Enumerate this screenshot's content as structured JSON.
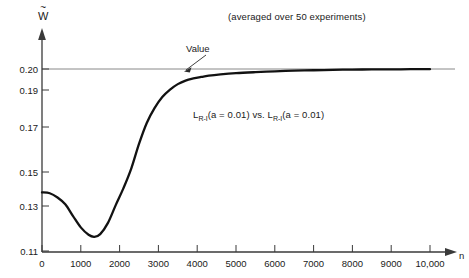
{
  "figure": {
    "subtitle": "(averaged over 50 experiments)",
    "y_axis_label": "W",
    "y_axis_label_accent": "~",
    "x_axis_label": "n"
  },
  "annotations": {
    "value_line_label": "Value",
    "series_label_prefix": "L",
    "series_label_sub": "R-I",
    "series_label_mid": "(a = 0.01) vs. L",
    "series_label_sub2": "R-I",
    "series_label_suffix": "(a = 0.01)",
    "series_label_full": "L_{R-I}(a = 0.01) vs. L_{R-I}(a = 0.01)"
  },
  "chart_data": {
    "type": "line",
    "title": "",
    "subtitle": "(averaged over 50 experiments)",
    "xlabel": "n",
    "ylabel": "W~",
    "xlim": [
      0,
      10000
    ],
    "ylim": [
      0.11,
      0.205
    ],
    "grid": false,
    "legend": "none",
    "x_ticks": [
      0,
      1000,
      2000,
      3000,
      4000,
      5000,
      6000,
      7000,
      8000,
      9000,
      10000
    ],
    "x_tick_labels": [
      "0",
      "1000",
      "2000",
      "3000",
      "4000",
      "5000",
      "6000",
      "7000",
      "8000",
      "9000",
      "10,000"
    ],
    "y_ticks": [
      0.11,
      0.13,
      0.15,
      0.17,
      0.19,
      0.2
    ],
    "y_tick_labels": [
      "0.11",
      "0.13",
      "0.15",
      "0.17",
      "0.19",
      "0.20"
    ],
    "reference_lines": [
      {
        "name": "Value",
        "orientation": "horizontal",
        "y": 0.2,
        "label": "Value"
      }
    ],
    "series": [
      {
        "name": "L_{R-I}(a = 0.01) vs. L_{R-I}(a = 0.01)",
        "x": [
          0,
          200,
          400,
          600,
          800,
          1000,
          1200,
          1350,
          1500,
          1700,
          1900,
          2100,
          2300,
          2500,
          2700,
          2900,
          3100,
          3300,
          3500,
          3700,
          3900,
          4100,
          4300,
          4600,
          5000,
          5500,
          6000,
          6500,
          7000,
          7500,
          8000,
          8500,
          9000,
          9500,
          10000
        ],
        "y": [
          0.138,
          0.1375,
          0.135,
          0.131,
          0.1255,
          0.1205,
          0.1172,
          0.1163,
          0.1175,
          0.1225,
          0.1305,
          0.1405,
          0.1515,
          0.1625,
          0.1722,
          0.1802,
          0.1862,
          0.1902,
          0.1928,
          0.1945,
          0.1955,
          0.1962,
          0.1968,
          0.1974,
          0.198,
          0.1985,
          0.1989,
          0.1992,
          0.1994,
          0.1996,
          0.1997,
          0.1998,
          0.1998,
          0.1999,
          0.1999
        ]
      }
    ]
  },
  "style": {
    "axis_color": "#3a3a3a",
    "curve_color": "#121212",
    "reference_line_color": "#7b7b7b",
    "text_color": "#1a1a1a",
    "background": "#ffffff"
  }
}
